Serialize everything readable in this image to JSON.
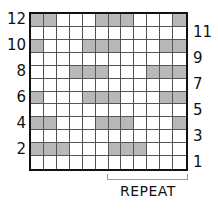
{
  "chart": {
    "columns": 12,
    "rows": 12,
    "filled_color": "#b8b8b8",
    "empty_color": "#ffffff",
    "left_row_labels": [
      "12",
      "10",
      "8",
      "6",
      "4",
      "2"
    ],
    "right_row_labels": [
      "11",
      "9",
      "7",
      "5",
      "3",
      "1"
    ],
    "repeat_label": "REPEAT",
    "repeat_columns": [
      7,
      12
    ]
  },
  "chart_data": {
    "type": "heatmap",
    "title": "",
    "xlabel": "REPEAT (columns 7–12)",
    "ylabel": "Row",
    "row_order": "top-to-bottom, row 12 to row 1",
    "filled_cells_by_row": {
      "12": [
        1,
        2,
        6,
        7,
        8,
        12
      ],
      "11": [],
      "10": [
        1,
        5,
        6,
        7,
        11,
        12
      ],
      "9": [],
      "8": [
        4,
        5,
        6,
        10,
        11,
        12
      ],
      "7": [],
      "6": [
        1,
        5,
        6,
        7,
        11,
        12
      ],
      "5": [],
      "4": [
        1,
        2,
        6,
        7,
        8,
        12
      ],
      "3": [],
      "2": [
        1,
        2,
        3,
        7,
        8,
        9
      ],
      "1": []
    }
  }
}
